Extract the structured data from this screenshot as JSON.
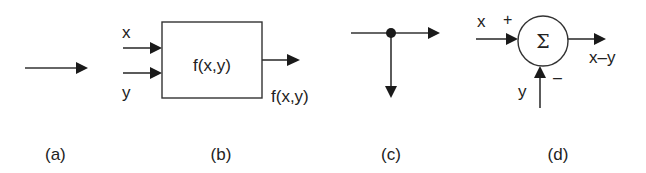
{
  "colors": {
    "background": "#ffffff",
    "stroke": "#333333",
    "text": "#222222"
  },
  "panels": [
    {
      "id": "a",
      "caption": "(a)",
      "kind": "signal-arrow"
    },
    {
      "id": "b",
      "caption": "(b)",
      "kind": "function-block",
      "inputs": [
        "x",
        "y"
      ],
      "block_label": "f(x,y)",
      "output_label": "f(x,y)"
    },
    {
      "id": "c",
      "caption": "(c)",
      "kind": "pickoff-point"
    },
    {
      "id": "d",
      "caption": "(d)",
      "kind": "summing-junction",
      "symbol": "Σ",
      "input_top": "x",
      "input_top_sign": "+",
      "input_bottom": "y",
      "input_bottom_sign": "–",
      "output_label": "x–y"
    }
  ]
}
